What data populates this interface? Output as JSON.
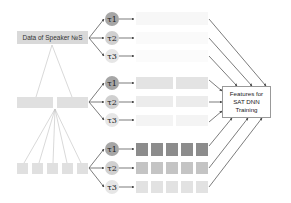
{
  "diagram": {
    "root_label": "Data of Speaker №S",
    "target_label_lines": [
      "Features for",
      "SAT DNN",
      "Training"
    ],
    "tau_labels": [
      "τ1",
      "τ2",
      "τ3"
    ],
    "levels": [
      {
        "name": "speaker-level",
        "segments": 1,
        "feature_blocks_per_row": 1
      },
      {
        "name": "half-level",
        "segments": 2,
        "feature_blocks_per_row": 2
      },
      {
        "name": "fifth-level",
        "segments": 5,
        "feature_blocks_per_row": 5
      }
    ],
    "colors": {
      "segment_box": "#d9d9d9",
      "tau1_fill": "#a6a6a6",
      "tau2_fill": "#d0d0d0",
      "tau3_fill": "#e6e6e6",
      "row_tau1_bottom": "#8c8c8c",
      "row_tau2_bottom": "#bfbfbf",
      "row_tau3_bottom": "#e0e0e0",
      "arrow": "#444444",
      "tree_line": "#b0b0b0"
    }
  }
}
